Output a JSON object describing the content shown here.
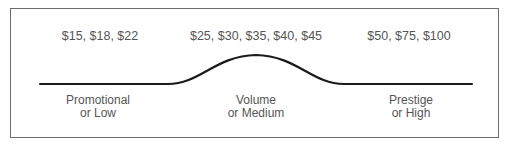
{
  "diagram": {
    "type": "price-tier-curve",
    "tiers": [
      {
        "name": "promotional",
        "prices": "$15, $18, $22",
        "label_line1": "Promotional",
        "label_line2": "or Low",
        "center_x": 100
      },
      {
        "name": "volume",
        "prices": "$25, $30, $35, $40, $45",
        "label_line1": "Volume",
        "label_line2": "or Medium",
        "center_x": 256
      },
      {
        "name": "prestige",
        "prices": "$50, $75, $100",
        "label_line1": "Prestige",
        "label_line2": "or High",
        "center_x": 409
      }
    ],
    "colors": {
      "curve": "#1a1a1a",
      "text": "#555555",
      "border": "#6b6b6b"
    }
  }
}
